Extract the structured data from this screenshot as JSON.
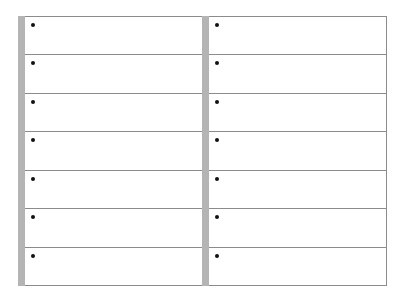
{
  "sheet": {
    "columns": [
      {
        "rows": [
          {
            "bullet": "•"
          },
          {
            "bullet": "•"
          },
          {
            "bullet": "•"
          },
          {
            "bullet": "•"
          },
          {
            "bullet": "•"
          },
          {
            "bullet": "•"
          },
          {
            "bullet": "•"
          }
        ]
      },
      {
        "rows": [
          {
            "bullet": "•"
          },
          {
            "bullet": "•"
          },
          {
            "bullet": "•"
          },
          {
            "bullet": "•"
          },
          {
            "bullet": "•"
          },
          {
            "bullet": "•"
          },
          {
            "bullet": "•"
          }
        ]
      }
    ],
    "colors": {
      "bar": "#b4b4b4",
      "line": "#8c8c8c",
      "bullet": "#111111"
    }
  }
}
